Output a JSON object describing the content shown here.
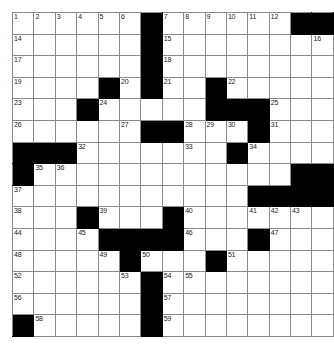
{
  "puzzle": {
    "type": "crossword-grid",
    "rows": 15,
    "cols": 15,
    "cell_size_px": 20.6,
    "colors": {
      "block": "#000000",
      "cell": "#ffffff",
      "gridline": "#8a8a8a",
      "number": "#1a1a1a",
      "background": "#ffffff"
    },
    "legend": {
      "0": "open cell (white, fillable)",
      "1": "blocked cell (black)"
    },
    "grid": [
      [
        0,
        0,
        0,
        0,
        0,
        0,
        1,
        0,
        0,
        0,
        0,
        0,
        0,
        1,
        1
      ],
      [
        0,
        0,
        0,
        0,
        0,
        0,
        1,
        0,
        0,
        0,
        0,
        0,
        0,
        0,
        0
      ],
      [
        0,
        0,
        0,
        0,
        0,
        0,
        1,
        0,
        0,
        0,
        0,
        0,
        0,
        0,
        0
      ],
      [
        0,
        0,
        0,
        0,
        1,
        0,
        1,
        0,
        0,
        1,
        0,
        0,
        0,
        0,
        0
      ],
      [
        0,
        0,
        0,
        1,
        0,
        0,
        0,
        0,
        0,
        1,
        1,
        1,
        0,
        0,
        0
      ],
      [
        0,
        0,
        0,
        0,
        0,
        0,
        1,
        1,
        0,
        0,
        0,
        1,
        0,
        0,
        0
      ],
      [
        1,
        1,
        1,
        0,
        0,
        0,
        0,
        0,
        0,
        0,
        1,
        0,
        0,
        0,
        0
      ],
      [
        1,
        0,
        0,
        0,
        0,
        0,
        0,
        0,
        0,
        0,
        0,
        0,
        0,
        1,
        1
      ],
      [
        0,
        0,
        0,
        0,
        0,
        0,
        0,
        0,
        0,
        0,
        0,
        1,
        1,
        1,
        1
      ],
      [
        0,
        0,
        0,
        1,
        0,
        0,
        0,
        1,
        0,
        0,
        0,
        0,
        0,
        0,
        0
      ],
      [
        0,
        0,
        0,
        0,
        1,
        1,
        1,
        1,
        0,
        0,
        0,
        1,
        0,
        0,
        0
      ],
      [
        0,
        0,
        0,
        0,
        0,
        1,
        0,
        0,
        0,
        1,
        0,
        0,
        0,
        0,
        0
      ],
      [
        0,
        0,
        0,
        0,
        0,
        0,
        1,
        0,
        0,
        0,
        0,
        0,
        0,
        0,
        0
      ],
      [
        0,
        0,
        0,
        0,
        0,
        0,
        1,
        0,
        0,
        0,
        0,
        0,
        0,
        0,
        0
      ],
      [
        1,
        0,
        0,
        0,
        0,
        0,
        1,
        0,
        0,
        0,
        0,
        0,
        0,
        0,
        0
      ]
    ],
    "numbers": [
      [
        1,
        2,
        3,
        4,
        5,
        6,
        null,
        7,
        8,
        9,
        10,
        11,
        12,
        13,
        null
      ],
      [
        14,
        null,
        null,
        null,
        null,
        null,
        null,
        15,
        null,
        null,
        null,
        null,
        null,
        null,
        16
      ],
      [
        17,
        null,
        null,
        null,
        null,
        null,
        null,
        18,
        null,
        null,
        null,
        null,
        null,
        null,
        null
      ],
      [
        19,
        null,
        null,
        null,
        null,
        20,
        null,
        21,
        null,
        null,
        22,
        null,
        null,
        null,
        null
      ],
      [
        23,
        null,
        null,
        null,
        24,
        null,
        null,
        null,
        null,
        null,
        null,
        null,
        25,
        null,
        null
      ],
      [
        26,
        null,
        null,
        null,
        null,
        27,
        null,
        null,
        28,
        29,
        30,
        null,
        31,
        null,
        null
      ],
      [
        null,
        null,
        null,
        32,
        null,
        null,
        null,
        null,
        33,
        null,
        null,
        34,
        null,
        null,
        null
      ],
      [
        null,
        35,
        36,
        null,
        null,
        null,
        null,
        null,
        null,
        null,
        null,
        null,
        null,
        null,
        null
      ],
      [
        37,
        null,
        null,
        null,
        null,
        null,
        null,
        null,
        null,
        null,
        null,
        null,
        null,
        null,
        null
      ],
      [
        38,
        null,
        null,
        null,
        39,
        null,
        null,
        null,
        40,
        null,
        null,
        41,
        42,
        43,
        null
      ],
      [
        44,
        null,
        null,
        45,
        null,
        null,
        null,
        null,
        46,
        null,
        null,
        null,
        47,
        null,
        null
      ],
      [
        48,
        null,
        null,
        null,
        49,
        null,
        50,
        null,
        null,
        null,
        51,
        null,
        null,
        null,
        null
      ],
      [
        52,
        null,
        null,
        null,
        null,
        53,
        null,
        54,
        55,
        null,
        null,
        null,
        null,
        null,
        null
      ],
      [
        56,
        null,
        null,
        null,
        null,
        null,
        null,
        57,
        null,
        null,
        null,
        null,
        null,
        null,
        null
      ],
      [
        null,
        58,
        null,
        null,
        null,
        null,
        null,
        59,
        null,
        null,
        null,
        null,
        null,
        null,
        null
      ]
    ]
  }
}
